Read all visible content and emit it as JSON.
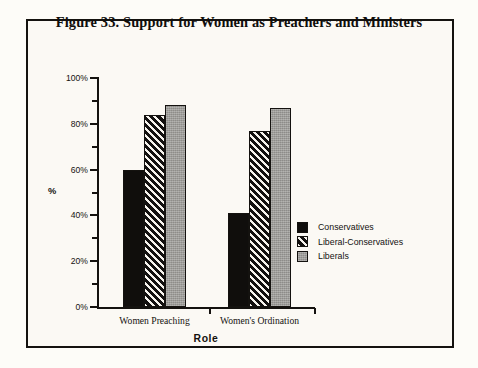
{
  "figure": {
    "title": "Figure 33. Support for Women as Preachers and Ministers",
    "background_color": "#fbf9f4",
    "border_color": "#14120f"
  },
  "chart_data": {
    "type": "bar",
    "title": "Figure 33. Support for Women as Preachers and Ministers",
    "xlabel": "Role",
    "ylabel": "%",
    "categories": [
      "Women Preaching",
      "Women's Ordination"
    ],
    "series": [
      {
        "name": "Conservatives",
        "values": [
          60,
          41
        ],
        "fill": "solid-black",
        "color": "#100e0c"
      },
      {
        "name": "Liberal-Conservatives",
        "values": [
          84,
          77
        ],
        "fill": "diagonal-hatch",
        "color": "#131110"
      },
      {
        "name": "Liberals",
        "values": [
          88,
          87
        ],
        "fill": "gray",
        "color": "#9b9a96"
      }
    ],
    "ylim": [
      0,
      100
    ],
    "y_major_ticks": [
      0,
      20,
      40,
      60,
      80,
      100
    ],
    "y_tick_labels": [
      "0%",
      "20%",
      "40%",
      "60%",
      "80%",
      "100%"
    ],
    "y_minor_ticks": [
      10,
      30,
      50,
      70,
      90
    ],
    "grid": false,
    "legend_position": "right"
  },
  "legend": {
    "items": [
      {
        "label": "Conservatives"
      },
      {
        "label": "Liberal-Conservatives"
      },
      {
        "label": "Liberals"
      }
    ]
  },
  "axes": {
    "x_title": "Role",
    "y_title": "%",
    "x_group_labels": [
      "Women Preaching",
      "Women's Ordination"
    ]
  }
}
